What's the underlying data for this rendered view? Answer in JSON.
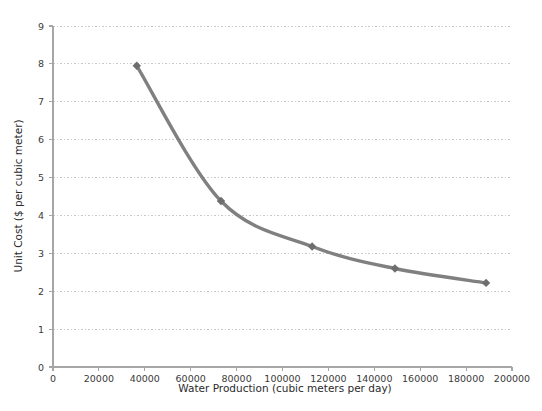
{
  "chart_data": {
    "type": "line",
    "title": "",
    "xlabel": "Water Production (cubic meters per day)",
    "ylabel": "Unit Cost ($ per cubic meter)",
    "xlim": [
      0,
      200000
    ],
    "ylim": [
      0,
      9
    ],
    "grid": true,
    "legend": "none",
    "xticks": [
      0,
      20000,
      40000,
      60000,
      80000,
      100000,
      120000,
      140000,
      160000,
      180000,
      200000
    ],
    "xtick_labels": [
      "0",
      "20000",
      "40000",
      "60000",
      "80000",
      "100000",
      "120000",
      "140000",
      "160000",
      "180000",
      "200000"
    ],
    "yticks": [
      0,
      1,
      2,
      3,
      4,
      5,
      6,
      7,
      8,
      9
    ],
    "ytick_labels": [
      "0",
      "1",
      "2",
      "3",
      "4",
      "5",
      "6",
      "7",
      "8",
      "9"
    ],
    "series": [
      {
        "name": "Unit Cost",
        "color": "#808080",
        "marker": "diamond",
        "x": [
          36500,
          73200,
          112900,
          149000,
          188700
        ],
        "y": [
          7.95,
          4.38,
          3.18,
          2.6,
          2.22
        ]
      }
    ]
  },
  "style": {
    "line_color": "#7f7f7f",
    "marker_color": "#6e6e6e",
    "grid_color": "#c8c8c8",
    "axis_color": "#a6a6a6",
    "text_color": "#3a3a3a",
    "background": "#ffffff"
  }
}
